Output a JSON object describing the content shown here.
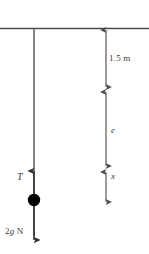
{
  "figure": {
    "type": "physics-free-body-diagram",
    "title_visible": false,
    "background_color": "#ffffff",
    "stroke_color": "#4a4a4a",
    "text_color": "#3a3a3a",
    "ball_color": "#000000"
  },
  "labels": {
    "tension": "T",
    "weight_prefix": "2",
    "weight_g": "g",
    "weight_suffix": " N",
    "weight_full": "2g N",
    "natural_length": "1.5 m",
    "extension": "e",
    "displacement": "x"
  },
  "elements": {
    "ceiling": "ceiling-line",
    "string": "string-line",
    "particle": "particle-ball",
    "tension_arrow": "tension-arrow-up",
    "weight_arrow": "weight-arrow-down",
    "dim_natural": "dimension-1.5m",
    "dim_extension": "dimension-e",
    "dim_displacement": "dimension-x"
  },
  "geometry": {
    "ceiling_y": 28,
    "string_x": 34,
    "ball_cx": 34,
    "ball_cy": 200,
    "ball_r": 6,
    "dim_x": 106,
    "dim_natural_from": 30,
    "dim_natural_to": 88,
    "dim_extension_from": 92,
    "dim_extension_to": 167,
    "dim_displacement_from": 172,
    "dim_displacement_to": 203
  }
}
